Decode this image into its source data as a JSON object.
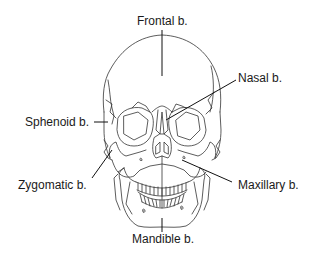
{
  "diagram": {
    "labels": [
      {
        "id": "frontal",
        "text": "Frontal b."
      },
      {
        "id": "nasal",
        "text": "Nasal b."
      },
      {
        "id": "sphenoid",
        "text": "Sphenoid b."
      },
      {
        "id": "zygomatic",
        "text": "Zygomatic b."
      },
      {
        "id": "maxillary",
        "text": "Maxillary b."
      },
      {
        "id": "mandible",
        "text": "Mandible b."
      }
    ],
    "colors": {
      "line": "#222222",
      "background": "#ffffff",
      "text": "#1a1a1a"
    }
  }
}
